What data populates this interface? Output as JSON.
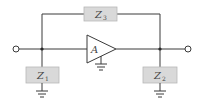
{
  "diagram": {
    "type": "circuit",
    "components": {
      "z3": {
        "label": "Z",
        "subscript": "3"
      },
      "z1": {
        "label": "Z",
        "subscript": "1"
      },
      "z2": {
        "label": "Z",
        "subscript": "2"
      },
      "amplifier": {
        "label": "A"
      }
    },
    "colors": {
      "wire": "#3a3a3a",
      "box_fill": "#d9d9d9",
      "box_stroke": "#b8b8b8"
    }
  }
}
